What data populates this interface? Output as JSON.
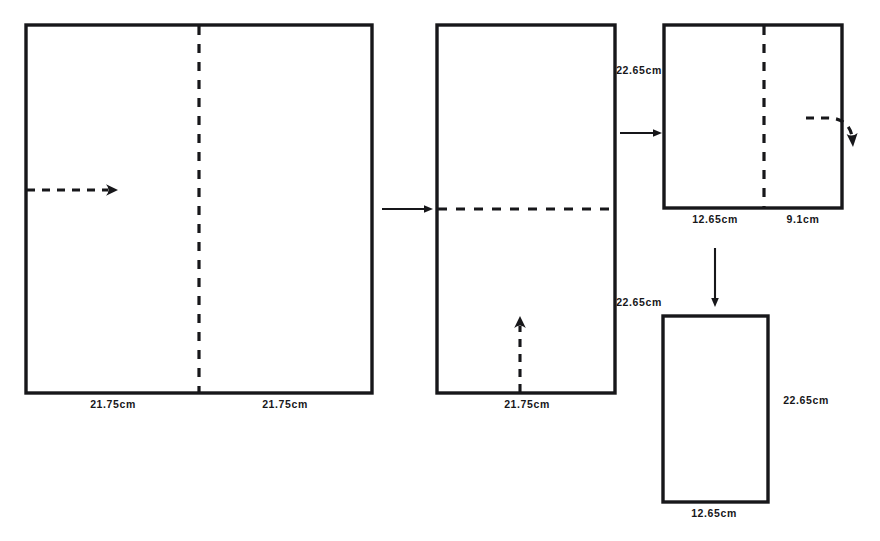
{
  "figure": {
    "type": "paper-folding-sequence-diagram",
    "background_color": "#ffffff",
    "ink_color": "#17171a",
    "steps": 4
  },
  "shapes": {
    "sheet1": {
      "name": "original-sheet",
      "x": 26,
      "y": 25,
      "width": 346,
      "height": 368,
      "fold_line": {
        "orientation": "vertical",
        "position_x": 199
      },
      "labels": {
        "bottom_left": "21.75cm",
        "bottom_right": "21.75cm"
      },
      "fold_arrow": {
        "style": "dashed-straight",
        "direction": "left-to-right",
        "from_x": 27,
        "to_x": 116,
        "y": 190
      }
    },
    "sheet2": {
      "name": "half-folded-sheet",
      "x": 437,
      "y": 25,
      "width": 178,
      "height": 368,
      "fold_line": {
        "orientation": "horizontal",
        "position_y": 209
      },
      "labels": {
        "bottom": "21.75cm",
        "right_top": "22.65cm",
        "right_bottom": "22.65cm"
      },
      "fold_arrow": {
        "style": "dashed-straight",
        "direction": "bottom-to-top",
        "x": 520,
        "from_y": 393,
        "to_y": 318
      }
    },
    "sheet3": {
      "name": "quarter-folded-sheet",
      "x": 664,
      "y": 25,
      "width": 178,
      "height": 183,
      "fold_line": {
        "orientation": "vertical",
        "position_x": 764
      },
      "labels": {
        "bottom_left": "12.65cm",
        "bottom_right": "9.1cm"
      },
      "fold_arrow": {
        "style": "dashed-curved",
        "direction": "right-over-edge-downward"
      }
    },
    "sheet4": {
      "name": "final-folded-sheet",
      "x": 663,
      "y": 316,
      "width": 105,
      "height": 186,
      "labels": {
        "bottom": "12.65cm",
        "right": "22.65cm"
      }
    }
  },
  "connectors": [
    {
      "name": "arrow-sheet1-to-sheet2",
      "orientation": "horizontal",
      "from_x": 382,
      "to_x": 433,
      "y": 209
    },
    {
      "name": "arrow-sheet2-to-sheet3",
      "orientation": "horizontal",
      "from_x": 620,
      "to_x": 662,
      "y": 133
    },
    {
      "name": "arrow-sheet3-to-sheet4",
      "orientation": "vertical",
      "x": 715,
      "from_y": 248,
      "to_y": 307
    }
  ],
  "labels": {
    "sheet1_bottom_left": "21.75cm",
    "sheet1_bottom_right": "21.75cm",
    "sheet2_bottom": "21.75cm",
    "sheet2_right_top": "22.65cm",
    "sheet2_right_bottom": "22.65cm",
    "sheet3_bottom_left": "12.65cm",
    "sheet3_bottom_right": "9.1cm",
    "sheet4_bottom": "12.65cm",
    "sheet4_right": "22.65cm"
  }
}
